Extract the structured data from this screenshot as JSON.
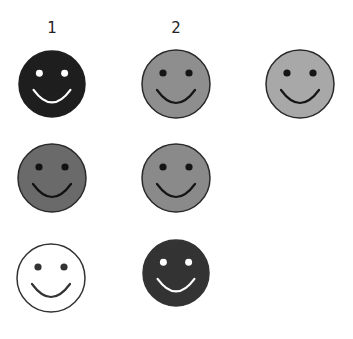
{
  "column_labels": [
    {
      "text": "1",
      "x": 52,
      "y": 19
    },
    {
      "text": "2",
      "x": 176,
      "y": 19
    }
  ],
  "faces": [
    {
      "id": "face-r1-c1",
      "cx": 52,
      "cy": 84,
      "r": 33,
      "fill": "#1e1e1e",
      "stroke": "#1e1e1e",
      "feature": "#ffffff"
    },
    {
      "id": "face-r1-c2",
      "cx": 176,
      "cy": 84,
      "r": 34,
      "fill": "#8e8e8e",
      "stroke": "#2a2a2a",
      "feature": "#151515"
    },
    {
      "id": "face-r1-c3",
      "cx": 300,
      "cy": 84,
      "r": 34,
      "fill": "#a8a8a8",
      "stroke": "#2a2a2a",
      "feature": "#151515"
    },
    {
      "id": "face-r2-c1",
      "cx": 52,
      "cy": 178,
      "r": 34,
      "fill": "#6a6a6a",
      "stroke": "#2a2a2a",
      "feature": "#111111"
    },
    {
      "id": "face-r2-c2",
      "cx": 176,
      "cy": 178,
      "r": 34,
      "fill": "#8a8a8a",
      "stroke": "#2a2a2a",
      "feature": "#151515"
    },
    {
      "id": "face-r3-c1",
      "cx": 51,
      "cy": 278,
      "r": 34,
      "fill": "#ffffff",
      "stroke": "#333333",
      "feature": "#333333"
    },
    {
      "id": "face-r3-c2",
      "cx": 176,
      "cy": 273,
      "r": 33,
      "fill": "#333333",
      "stroke": "#333333",
      "feature": "#ffffff"
    }
  ]
}
